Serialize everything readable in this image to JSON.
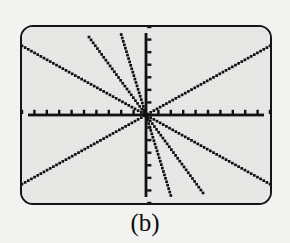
{
  "figure": {
    "caption": "(b)",
    "label": "b",
    "device": "graphing-calculator-screen"
  },
  "colors": {
    "page_background": "#f2f2f0",
    "screen_background": "#e9e9e7",
    "bezel_border": "#141414",
    "ink": "#121212",
    "caption_text": "#0d0d0d"
  },
  "chart_data": {
    "type": "line",
    "title": "",
    "subtitle": "",
    "xlabel": "",
    "ylabel": "",
    "xlim": [
      -10,
      10
    ],
    "ylim": [
      -7,
      7
    ],
    "grid": false,
    "legend": false,
    "legend_position": "none",
    "axes": {
      "x_axis": {
        "visible": true,
        "tick_marks": true,
        "tick_count": 20,
        "tick_spacing": 1,
        "tick_labels": [],
        "style": "dotted-pixel"
      },
      "y_axis": {
        "visible": true,
        "tick_marks": true,
        "tick_count": 14,
        "tick_spacing": 1,
        "tick_labels": [],
        "style": "dotted-pixel"
      }
    },
    "origin": [
      0,
      0
    ],
    "render_style": "dotted",
    "series": [
      {
        "name": "line-1",
        "slope": 0.55,
        "intercept": 0,
        "x": [
          -10,
          10
        ],
        "values": [
          -5.5,
          5.5
        ]
      },
      {
        "name": "line-2",
        "slope": -0.55,
        "intercept": 0,
        "x": [
          -10,
          10
        ],
        "values": [
          5.5,
          -5.5
        ]
      },
      {
        "name": "line-3",
        "slope": -1.35,
        "intercept": 0,
        "x": [
          -4.6,
          4.6
        ],
        "values": [
          6.2,
          -6.2
        ]
      },
      {
        "name": "line-4",
        "slope": -3.2,
        "intercept": 0,
        "x": [
          -2.0,
          2.0
        ],
        "values": [
          6.4,
          -6.4
        ]
      }
    ]
  }
}
